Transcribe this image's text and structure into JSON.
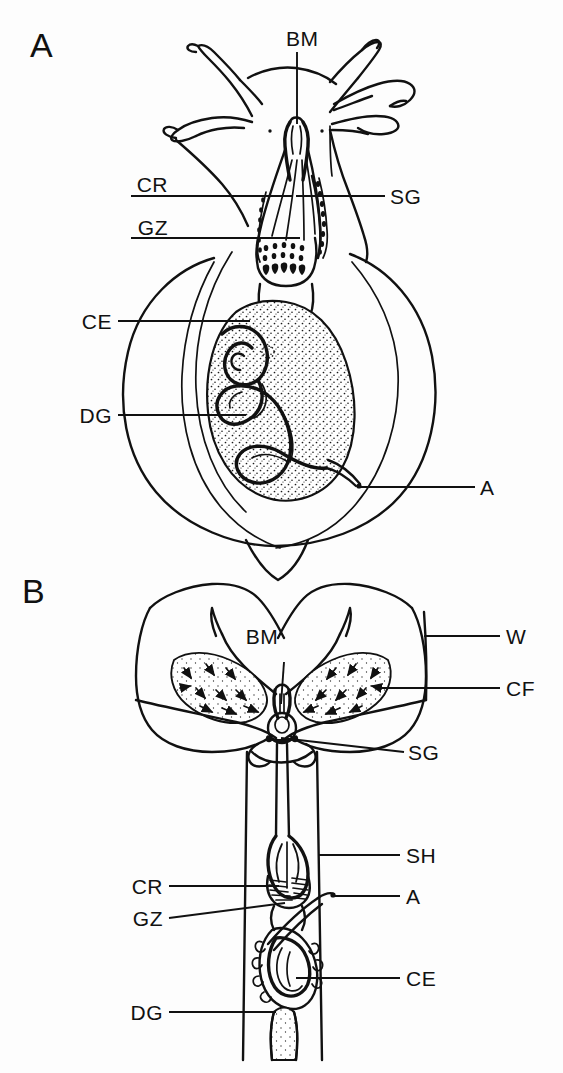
{
  "figure": {
    "background_color": "#fdfdfd",
    "ink_color": "#111111",
    "panels": [
      {
        "letter": "A",
        "name": "whole-animal-lateral-view",
        "labels": [
          {
            "key": "BM",
            "text": "BM",
            "meaning": "buccal mass",
            "side": "top"
          },
          {
            "key": "CR",
            "text": "CR",
            "meaning": "crop",
            "side": "left"
          },
          {
            "key": "GZ",
            "text": "GZ",
            "meaning": "gizzard",
            "side": "left"
          },
          {
            "key": "CE",
            "text": "CE",
            "meaning": "caecum",
            "side": "left"
          },
          {
            "key": "DG",
            "text": "DG",
            "meaning": "digestive gland",
            "side": "left"
          },
          {
            "key": "SG",
            "text": "SG",
            "meaning": "salivary gland",
            "side": "right"
          },
          {
            "key": "A",
            "text": "A",
            "meaning": "anus",
            "side": "right"
          }
        ]
      },
      {
        "letter": "B",
        "name": "dissected-dorsal-view",
        "labels": [
          {
            "key": "BM",
            "text": "BM",
            "meaning": "buccal mass",
            "side": "top"
          },
          {
            "key": "W",
            "text": "W",
            "meaning": "wall",
            "side": "right"
          },
          {
            "key": "CF",
            "text": "CF",
            "meaning": "ciliated field",
            "side": "right"
          },
          {
            "key": "SG",
            "text": "SG",
            "meaning": "salivary gland",
            "side": "right"
          },
          {
            "key": "SH",
            "text": "SH",
            "meaning": "sheath",
            "side": "right"
          },
          {
            "key": "A",
            "text": "A",
            "meaning": "anus",
            "side": "right"
          },
          {
            "key": "CE",
            "text": "CE",
            "meaning": "caecum",
            "side": "right"
          },
          {
            "key": "CR",
            "text": "CR",
            "meaning": "crop",
            "side": "left"
          },
          {
            "key": "GZ",
            "text": "GZ",
            "meaning": "gizzard",
            "side": "left"
          },
          {
            "key": "DG",
            "text": "DG",
            "meaning": "digestive gland",
            "side": "left"
          }
        ]
      }
    ]
  },
  "panelA": {
    "letter": "A",
    "bm": "BM",
    "cr": "CR",
    "gz": "GZ",
    "ce": "CE",
    "dg": "DG",
    "sg": "SG",
    "a": "A"
  },
  "panelB": {
    "letter": "B",
    "bm": "BM",
    "w": "W",
    "cf": "CF",
    "sg": "SG",
    "sh": "SH",
    "a": "A",
    "ce": "CE",
    "cr": "CR",
    "gz": "GZ",
    "dg": "DG"
  }
}
